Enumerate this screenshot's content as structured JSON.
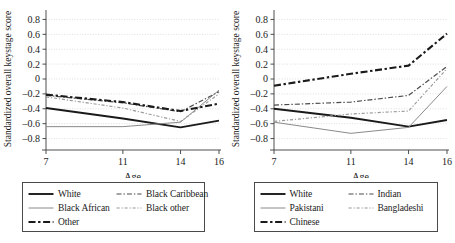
{
  "figure": {
    "panels": [
      {
        "id": "left",
        "axis": {
          "ylabel": "Standardized overall keystage score",
          "xlabel": "Age",
          "xticks": [
            7,
            11,
            14,
            16
          ],
          "yticks": [
            "0.8",
            "0.6",
            "0.4",
            "0.2",
            "0",
            "-0.2",
            "-0.4",
            "-0.6",
            "-0.8"
          ],
          "ylim": [
            -0.9,
            0.9
          ],
          "xlim": [
            7,
            16
          ]
        },
        "legend": [
          {
            "label": "White",
            "style": "thick-solid"
          },
          {
            "label": "Black Caribbean",
            "style": "dash-dot"
          },
          {
            "label": "Black African",
            "style": "thin-solid"
          },
          {
            "label": "Black other",
            "style": "fine-dash-dot"
          },
          {
            "label": "Other",
            "style": "thick-dash"
          }
        ],
        "chart_data": {
          "type": "line",
          "title": "",
          "xlabel": "Age",
          "ylabel": "Standardized overall keystage score",
          "x": [
            7,
            11,
            14,
            16
          ],
          "xlim": [
            7,
            16
          ],
          "ylim": [
            -0.9,
            0.9
          ],
          "grid": true,
          "legend_position": "below",
          "series": [
            {
              "name": "White",
              "style": "thick-solid",
              "values": [
                -0.39,
                -0.53,
                -0.65,
                -0.56
              ]
            },
            {
              "name": "Black Caribbean",
              "style": "dash-dot",
              "values": [
                -0.22,
                -0.32,
                -0.44,
                -0.17
              ]
            },
            {
              "name": "Black African",
              "style": "thin-solid",
              "values": [
                -0.64,
                -0.64,
                -0.58,
                -0.15
              ]
            },
            {
              "name": "Black other",
              "style": "fine-dash-dot",
              "values": [
                -0.24,
                -0.39,
                -0.57,
                -0.2
              ]
            },
            {
              "name": "Other",
              "style": "thick-dash",
              "values": [
                -0.21,
                -0.31,
                -0.43,
                -0.33
              ]
            }
          ]
        }
      },
      {
        "id": "right",
        "axis": {
          "ylabel": "Standardized overall keystage score",
          "xlabel": "Age",
          "xticks": [
            7,
            11,
            14,
            16
          ],
          "yticks": [
            "0.8",
            "0.6",
            "0.4",
            "0.2",
            "0",
            "-0.2",
            "-0.4",
            "-0.6",
            "-0.8"
          ],
          "ylim": [
            -0.9,
            0.9
          ],
          "xlim": [
            7,
            16
          ]
        },
        "legend": [
          {
            "label": "White",
            "style": "thick-solid"
          },
          {
            "label": "Indian",
            "style": "dash-dot"
          },
          {
            "label": "Pakistani",
            "style": "thin-solid"
          },
          {
            "label": "Bangladeshi",
            "style": "fine-dash-dot"
          },
          {
            "label": "Chinese",
            "style": "thick-dash"
          }
        ],
        "chart_data": {
          "type": "line",
          "title": "",
          "xlabel": "Age",
          "ylabel": "Standardized overall keystage score",
          "x": [
            7,
            11,
            14,
            16
          ],
          "xlim": [
            7,
            16
          ],
          "ylim": [
            -0.9,
            0.9
          ],
          "grid": true,
          "legend_position": "below",
          "series": [
            {
              "name": "White",
              "style": "thick-solid",
              "values": [
                -0.4,
                -0.52,
                -0.64,
                -0.55
              ]
            },
            {
              "name": "Indian",
              "style": "dash-dot",
              "values": [
                -0.35,
                -0.31,
                -0.22,
                0.17
              ]
            },
            {
              "name": "Pakistani",
              "style": "thin-solid",
              "values": [
                -0.58,
                -0.73,
                -0.65,
                -0.1
              ]
            },
            {
              "name": "Bangladeshi",
              "style": "fine-dash-dot",
              "values": [
                -0.57,
                -0.47,
                -0.43,
                0.14
              ]
            },
            {
              "name": "Chinese",
              "style": "thick-dash",
              "values": [
                -0.09,
                0.07,
                0.18,
                0.61
              ]
            }
          ]
        }
      }
    ]
  }
}
